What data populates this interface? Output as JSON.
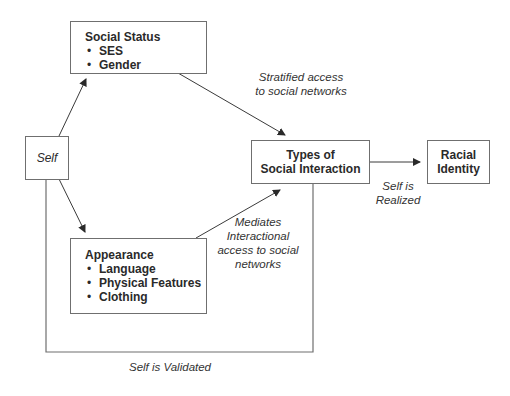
{
  "diagram": {
    "nodes": {
      "self": {
        "label": "Self"
      },
      "social_status": {
        "title": "Social Status",
        "items": [
          "SES",
          "Gender"
        ]
      },
      "appearance": {
        "title": "Appearance",
        "items": [
          "Language",
          "Physical Features",
          "Clothing"
        ]
      },
      "types_interaction": {
        "line1": "Types of",
        "line2": "Social Interaction"
      },
      "racial_identity": {
        "line1": "Racial",
        "line2": "Identity"
      }
    },
    "edges": {
      "stratified": {
        "line1": "Stratified access",
        "line2": "to social networks"
      },
      "mediates": {
        "line1": "Mediates",
        "line2": "Interactional",
        "line3": "access to social",
        "line4": "networks"
      },
      "realized": {
        "line1": "Self is",
        "line2": "Realized"
      },
      "validated": {
        "label": "Self is Validated"
      }
    },
    "bullet_glyph": "•",
    "colors": {
      "line": "#3a3a3a",
      "box_border": "#6f6f6f",
      "text": "#2a2a2a"
    }
  }
}
